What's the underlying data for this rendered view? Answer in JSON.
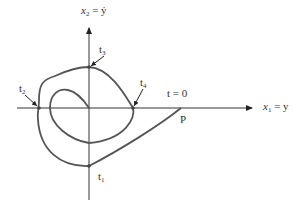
{
  "diagram": {
    "type": "phase-plane-trajectory",
    "axes": {
      "horizontal": {
        "var": "x",
        "sub": "1",
        "rhs": " = y"
      },
      "vertical": {
        "var": "x",
        "sub": "2",
        "rhs": " = ẏ"
      }
    },
    "points": [
      {
        "id": "t1",
        "base": "t",
        "sub": "1"
      },
      {
        "id": "t2",
        "base": "t",
        "sub": "2"
      },
      {
        "id": "t3",
        "base": "t",
        "sub": "3"
      },
      {
        "id": "t4",
        "base": "t",
        "sub": "4"
      }
    ],
    "start_label": "t = 0",
    "start_point": "P",
    "colors": {
      "curve": "#555555",
      "axis": "#333333",
      "marker": "#444444"
    }
  }
}
